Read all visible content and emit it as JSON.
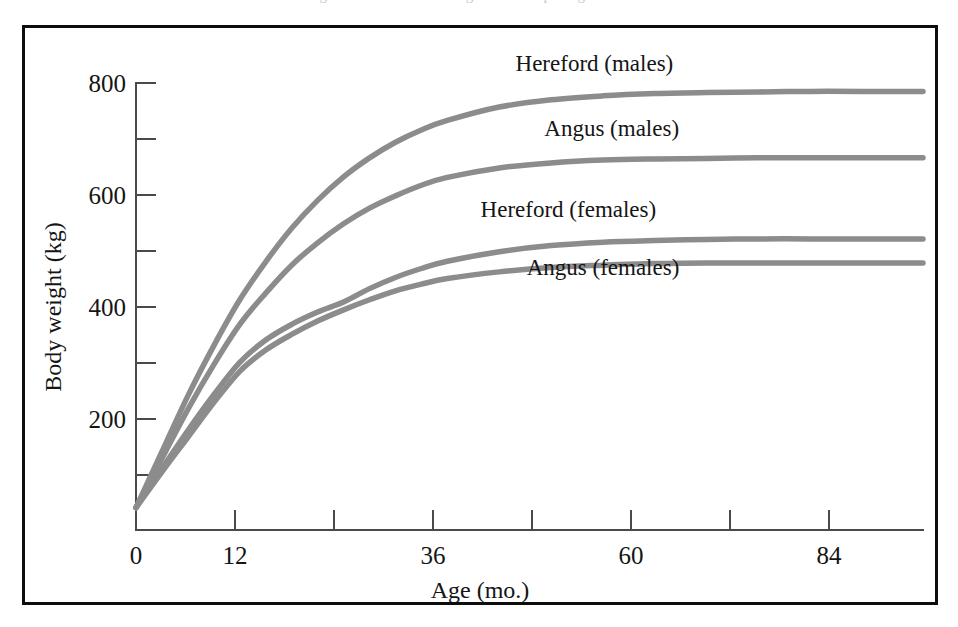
{
  "figure": {
    "scan_sliver_text": "nt of the growth curve and the age at which peak growth rate occurs",
    "border_color": "#0d0d0d",
    "background_color": "#ffffff",
    "curve_color": "#8c8c8c",
    "axis_color": "#4a4a4a"
  },
  "chart_data": {
    "type": "line",
    "title": "",
    "xlabel": "Age (mo.)",
    "ylabel": "Body weight (kg)",
    "xlim": [
      0,
      91
    ],
    "ylim": [
      0,
      830
    ],
    "grid": false,
    "legend_position": "inline-labels",
    "x_ticks_major": [
      0,
      12,
      36,
      60,
      84
    ],
    "x_ticks_minor": [
      24,
      48,
      72
    ],
    "x_tick_labels": [
      "0",
      "12",
      "36",
      "60",
      "84"
    ],
    "y_ticks_major": [
      200,
      400,
      600,
      800
    ],
    "y_ticks_minor": [
      100,
      300,
      500,
      700
    ],
    "y_tick_labels": [
      "200",
      "400",
      "600",
      "800"
    ],
    "x": [
      0,
      3,
      6,
      9,
      12,
      15,
      18,
      21,
      24,
      27,
      30,
      33,
      36,
      42,
      48,
      54,
      60,
      66,
      72,
      78,
      84,
      91
    ],
    "series": [
      {
        "name": "Hereford (males)",
        "label": "Hereford (males)",
        "label_x": 53,
        "label_y": 822,
        "asymptote": 785,
        "values": [
          40,
          140,
          240,
          330,
          412,
          480,
          540,
          590,
          632,
          666,
          694,
          716,
          733,
          757,
          770,
          777,
          781,
          783,
          784,
          785,
          785,
          785
        ]
      },
      {
        "name": "Angus (males)",
        "label": "Angus (males)",
        "label_x": 55,
        "label_y": 705,
        "asymptote": 666,
        "values": [
          40,
          128,
          216,
          296,
          368,
          424,
          474,
          514,
          548,
          576,
          598,
          617,
          631,
          648,
          657,
          662,
          664,
          665,
          666,
          666,
          666,
          666
        ]
      },
      {
        "name": "Hereford (females)",
        "label": "Hereford (females)",
        "label_x": 50,
        "label_y": 560,
        "asymptote": 521,
        "values": [
          40,
          110,
          178,
          242,
          300,
          340,
          368,
          390,
          408,
          432,
          452,
          468,
          481,
          498,
          509,
          515,
          518,
          520,
          521,
          521,
          521,
          521
        ]
      },
      {
        "name": "Angus (females)",
        "label": "Angus (females)",
        "label_x": 54,
        "label_y": 457,
        "asymptote": 478,
        "values": [
          40,
          104,
          166,
          228,
          284,
          322,
          350,
          374,
          394,
          412,
          428,
          440,
          450,
          462,
          470,
          474,
          477,
          478,
          478,
          478,
          478,
          478
        ]
      }
    ]
  }
}
